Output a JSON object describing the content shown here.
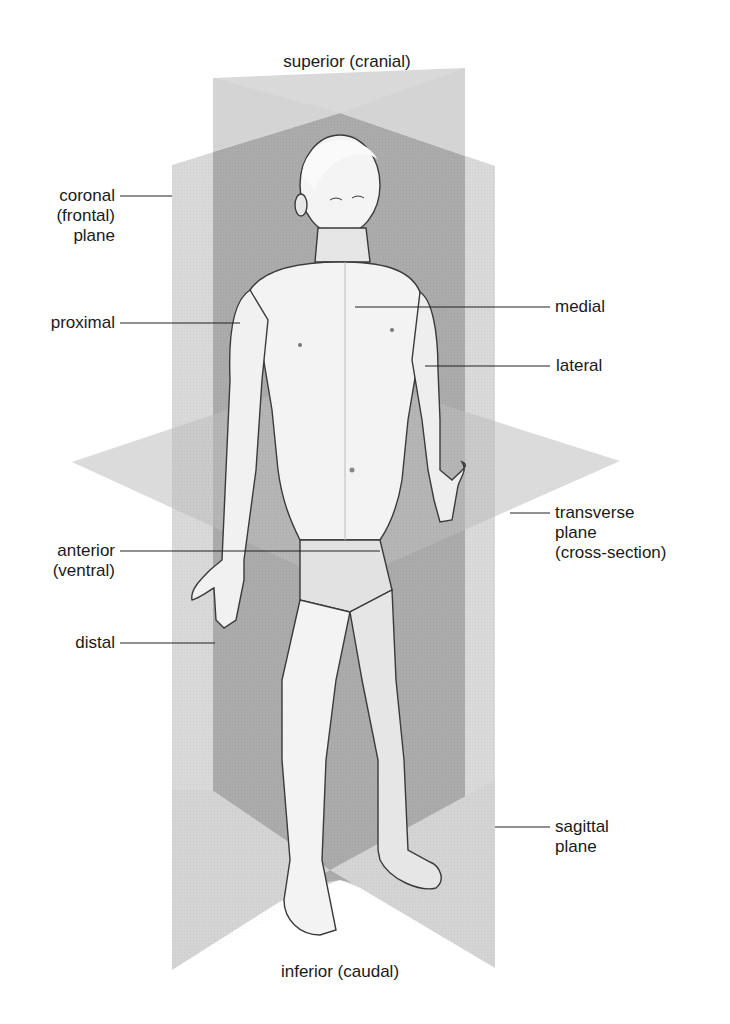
{
  "figure": {
    "colors": {
      "background": "#ffffff",
      "plane_light": "#d6d6d6",
      "plane_dark": "#a9a9a9",
      "plane_overlap": "#9a9a9a",
      "skin_light": "#f4f4f4",
      "skin_shade": "#c8c8c8",
      "outline": "#3a3a3a",
      "text": "#1a1a1a"
    }
  },
  "labels": {
    "superior": "superior (cranial)",
    "inferior": "inferior (caudal)",
    "coronal": [
      "coronal",
      "(frontal)",
      "plane"
    ],
    "proximal": "proximal",
    "anterior": [
      "anterior",
      "(ventral)"
    ],
    "distal": "distal",
    "medial": "medial",
    "lateral": "lateral",
    "transverse": [
      "transverse",
      "plane",
      "(cross-section)"
    ],
    "sagittal": [
      "sagittal",
      "plane"
    ]
  }
}
